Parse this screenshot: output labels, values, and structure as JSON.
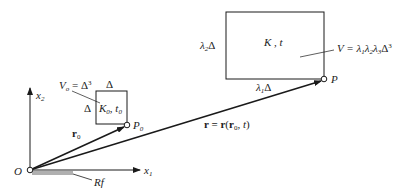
{
  "diagram": {
    "type": "kinematics-reference-configuration",
    "colors": {
      "stroke": "#1a1a1a",
      "ground_hatch": "#b0b0b0",
      "background": "#ffffff"
    },
    "axes": {
      "origin_label": "O",
      "x1_label": "x",
      "x1_sub": "1",
      "x2_label": "x",
      "x2_sub": "2",
      "reference_frame_label": "Rf"
    },
    "initial_element": {
      "volume_label": "V",
      "volume_sub": "o",
      "volume_eq": " = Δ",
      "volume_sup": "3",
      "top_side_label": "Δ",
      "left_side_label": "Δ",
      "config_label_K": "K",
      "config_sub_K": "0",
      "config_sep": ", ",
      "config_label_t": "t",
      "config_sub_t": "0",
      "point_label": "P",
      "point_sub": "0"
    },
    "current_element": {
      "config_label": "K , t",
      "volume_label": "V = λ",
      "volume_subs": [
        "1",
        "2",
        "3"
      ],
      "volume_suffix": "Δ",
      "volume_sup": "3",
      "left_side_label": "λ",
      "left_side_sub": "2",
      "left_side_suffix": "Δ",
      "bottom_side_label": "λ",
      "bottom_side_sub": "1",
      "bottom_side_suffix": "Δ",
      "point_label": "P"
    },
    "vectors": {
      "r0_label": "r",
      "r0_sub": "0",
      "r_label": "r = r",
      "r_args_open": "(",
      "r_args_r": "r",
      "r_args_sub": "0",
      "r_args_rest": ", t",
      "r_args_close": ")"
    }
  }
}
